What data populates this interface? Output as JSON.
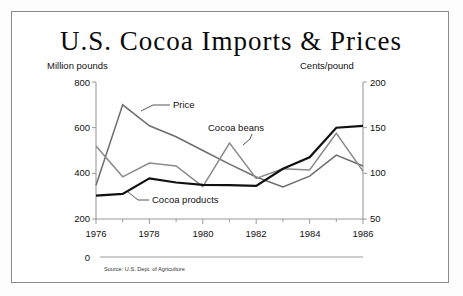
{
  "title": "U.S. Cocoa Imports & Prices",
  "source": "Source: U.S. Dept. of Agriculture",
  "zero_label": "0",
  "axes": {
    "left_header": "Million pounds",
    "right_header": "Cents/pound",
    "left_ticks": [
      "800",
      "600",
      "400",
      "200"
    ],
    "right_ticks": [
      "200",
      "150",
      "100",
      "50"
    ],
    "x_ticks": [
      "1976",
      "1978",
      "1980",
      "1982",
      "1984",
      "1986"
    ]
  },
  "labels": {
    "price": "Price",
    "cocoa_beans": "Cocoa beans",
    "cocoa_products": "Cocoa products"
  },
  "colors": {
    "price_line": "#6d6d6d",
    "beans_line": "#8a8a8a",
    "products_line": "#111111",
    "axis": "#9a9a9a",
    "frame": "#8a8a8a",
    "text": "#111111"
  },
  "chart_data": {
    "type": "line",
    "title": "U.S. Cocoa Imports & Prices",
    "xlabel": "",
    "ylabel": "Million pounds",
    "y2label": "Cents/pound",
    "x": [
      1976,
      1977,
      1978,
      1979,
      1980,
      1981,
      1982,
      1983,
      1984,
      1985,
      1986
    ],
    "ylim": [
      200,
      800
    ],
    "y2lim": [
      50,
      200
    ],
    "grid": false,
    "legend": "inline-annotations",
    "series": [
      {
        "name": "Price",
        "axis": "right",
        "unit": "cents/pound",
        "values": [
          87,
          175,
          152,
          140,
          125,
          110,
          96,
          85,
          97,
          120,
          108
        ]
      },
      {
        "name": "Cocoa beans",
        "axis": "left",
        "unit": "million pounds",
        "values": [
          520,
          385,
          445,
          432,
          342,
          533,
          378,
          420,
          415,
          575,
          410
        ]
      },
      {
        "name": "Cocoa products",
        "axis": "left",
        "unit": "million pounds",
        "values": [
          302,
          310,
          378,
          360,
          350,
          348,
          345,
          420,
          470,
          600,
          608
        ]
      }
    ]
  }
}
